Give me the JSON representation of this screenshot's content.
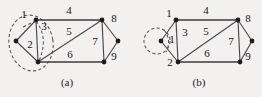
{
  "figure": {
    "caption_a": "(a)",
    "caption_b": "(b)",
    "background_color": "#f2f1ef",
    "edge_color": "#4a4a50",
    "node_color": "#1d1d20",
    "dashed_color": "#55555c"
  },
  "graph_a": {
    "name": "(a)",
    "edge_labels": {
      "e1": "1",
      "e2": "2",
      "e3": "3",
      "e4": "4",
      "e5": "5",
      "e6": "6",
      "e7": "7",
      "e8": "8",
      "e9": "9"
    },
    "vertices": [
      {
        "id": "left",
        "x": 16,
        "y": 41
      },
      {
        "id": "top",
        "x": 36,
        "y": 20
      },
      {
        "id": "bottom",
        "x": 38,
        "y": 62
      },
      {
        "id": "right",
        "x": 102,
        "y": 20
      },
      {
        "id": "far",
        "x": 118,
        "y": 41
      },
      {
        "id": "br",
        "x": 104,
        "y": 62
      }
    ],
    "edges": [
      {
        "label": "1",
        "from": "left",
        "to": "top"
      },
      {
        "label": "2",
        "from": "left",
        "to": "bottom"
      },
      {
        "label": "3",
        "from": "top",
        "to": "bottom"
      },
      {
        "label": "4",
        "from": "top",
        "to": "right"
      },
      {
        "label": "5",
        "from": "bottom",
        "to": "right"
      },
      {
        "label": "6",
        "from": "bottom",
        "to": "br"
      },
      {
        "label": "7",
        "from": "right",
        "to": "br"
      },
      {
        "label": "8",
        "from": "right",
        "to": "far"
      },
      {
        "label": "9",
        "from": "far",
        "to": "br"
      }
    ],
    "annotation": "dashed-ellipse-around-contracted-set"
  },
  "graph_b": {
    "name": "(b)",
    "edge_labels": {
      "e1": "1",
      "e3": "3",
      "e4": "4",
      "e5": "5",
      "e6": "6",
      "e7": "7",
      "e8": "8",
      "e9": "9"
    },
    "vertices": [
      {
        "id": "left",
        "x": 161,
        "y": 41
      },
      {
        "id": "top",
        "x": 176,
        "y": 20
      },
      {
        "id": "bottom",
        "x": 178,
        "y": 62
      },
      {
        "id": "right",
        "x": 238,
        "y": 20
      },
      {
        "id": "far",
        "x": 252,
        "y": 41
      },
      {
        "id": "br",
        "x": 240,
        "y": 62
      }
    ],
    "edges": [
      {
        "label": "1",
        "from": "left",
        "to": "top"
      },
      {
        "label": "",
        "from": "left",
        "to": "bottom"
      },
      {
        "label": "3",
        "from": "top",
        "to": "bottom"
      },
      {
        "label": "4",
        "from": "top",
        "to": "right"
      },
      {
        "label": "5",
        "from": "bottom",
        "to": "right"
      },
      {
        "label": "6",
        "from": "bottom",
        "to": "br"
      },
      {
        "label": "7",
        "from": "right",
        "to": "br"
      },
      {
        "label": "8",
        "from": "right",
        "to": "far"
      },
      {
        "label": "9",
        "from": "far",
        "to": "br"
      }
    ],
    "annotation": "dashed-self-loop-at-left-vertex"
  },
  "vertex_labels": {
    "a_one": "1",
    "a_two": "2",
    "b_one": "1",
    "b_two": "2"
  }
}
